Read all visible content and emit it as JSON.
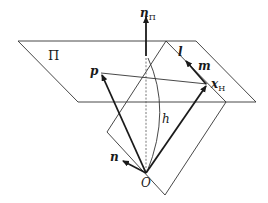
{
  "diagram": {
    "type": "geometric-vector-diagram",
    "labels": {
      "plane": "Π",
      "normal_plane_main": "n",
      "normal_plane_sub": "Π",
      "p": "p",
      "l": "l",
      "m": "m",
      "x_main": "x",
      "x_sub": "H",
      "h": "h",
      "n": "n",
      "origin": "O"
    },
    "colors": {
      "line": "#1a1a1a",
      "thin_line": "#333333",
      "background": "#ffffff"
    },
    "elements": [
      {
        "name": "horizontal-plane-Π",
        "shape": "parallelogram"
      },
      {
        "name": "vertical-plane",
        "shape": "parallelogram"
      },
      {
        "name": "normal-vector-nΠ",
        "shape": "arrow",
        "direction": "up"
      },
      {
        "name": "vector-p",
        "shape": "arrow",
        "from": "O",
        "to": "p"
      },
      {
        "name": "vector-xH",
        "shape": "arrow",
        "from": "O",
        "to": "xH"
      },
      {
        "name": "vector-m",
        "shape": "arrow",
        "along": "l"
      },
      {
        "name": "vector-n",
        "shape": "arrow",
        "from": "O"
      },
      {
        "name": "segment-p-xH",
        "shape": "line"
      },
      {
        "name": "dashed-vertical",
        "shape": "dashed-line"
      },
      {
        "name": "arc-h",
        "shape": "curve"
      }
    ]
  }
}
